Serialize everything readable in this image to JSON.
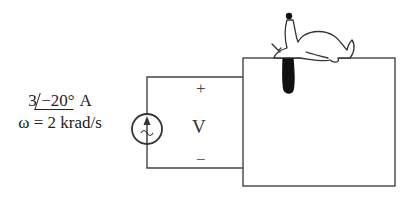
{
  "source": {
    "magnitude": "3",
    "angle": "−20°",
    "unit": "A",
    "frequency": "ω = 2 krad/s",
    "type": "ac-current-source"
  },
  "terminals": {
    "plus": "+",
    "voltage": "V",
    "minus": "−"
  },
  "colors": {
    "line": "#444444",
    "ear": "#111111"
  }
}
